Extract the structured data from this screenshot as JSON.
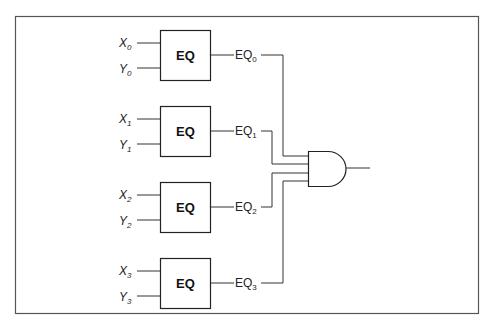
{
  "figure": {
    "frame_color": "#555555",
    "line_color": "#333333",
    "comparators": [
      {
        "label": "EQ",
        "input_x": "X",
        "input_y": "Y",
        "index": "0",
        "output_label": "EQ",
        "output_index": "0"
      },
      {
        "label": "EQ",
        "input_x": "X",
        "input_y": "Y",
        "index": "1",
        "output_label": "EQ",
        "output_index": "1"
      },
      {
        "label": "EQ",
        "input_x": "X",
        "input_y": "Y",
        "index": "2",
        "output_label": "EQ",
        "output_index": "2"
      },
      {
        "label": "EQ",
        "input_x": "X",
        "input_y": "Y",
        "index": "3",
        "output_label": "EQ",
        "output_index": "3"
      }
    ],
    "and_gate": {
      "inputs": 4,
      "type": "AND"
    },
    "caption_clipped": "Four-bit comparator (partially cut off)"
  }
}
